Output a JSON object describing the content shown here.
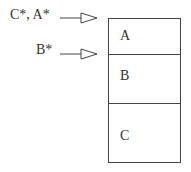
{
  "diagram": {
    "pointers": [
      {
        "label": "C*, A*",
        "target": "A"
      },
      {
        "label": "B*",
        "target": "B"
      }
    ],
    "stack": [
      {
        "label": "A"
      },
      {
        "label": "B"
      },
      {
        "label": "C"
      }
    ],
    "colors": {
      "stroke": "#444444",
      "text": "#333333",
      "background": "#ffffff"
    }
  }
}
